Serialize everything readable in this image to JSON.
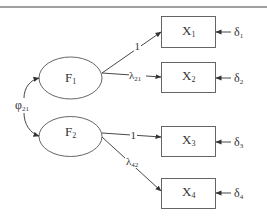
{
  "diagram": {
    "type": "confirmatory-factor-analysis-path-diagram",
    "factors": [
      {
        "id": "F1",
        "label": "F",
        "sub": "1"
      },
      {
        "id": "F2",
        "label": "F",
        "sub": "2"
      }
    ],
    "indicators": [
      {
        "id": "X1",
        "label": "X",
        "sub": "1"
      },
      {
        "id": "X2",
        "label": "X",
        "sub": "2"
      },
      {
        "id": "X3",
        "label": "X",
        "sub": "3"
      },
      {
        "id": "X4",
        "label": "X",
        "sub": "4"
      }
    ],
    "errors": [
      {
        "id": "d1",
        "label": "δ",
        "sub": "1"
      },
      {
        "id": "d2",
        "label": "δ",
        "sub": "2"
      },
      {
        "id": "d3",
        "label": "δ",
        "sub": "3"
      },
      {
        "id": "d4",
        "label": "δ",
        "sub": "4"
      }
    ],
    "loadings": [
      {
        "from": "F1",
        "to": "X1",
        "label": "1",
        "sub": ""
      },
      {
        "from": "F1",
        "to": "X2",
        "label": "λ",
        "sub": "21"
      },
      {
        "from": "F2",
        "to": "X3",
        "label": "1",
        "sub": ""
      },
      {
        "from": "F2",
        "to": "X4",
        "label": "λ",
        "sub": "42"
      }
    ],
    "covariance": {
      "between": [
        "F1",
        "F2"
      ],
      "label": "φ",
      "sub": "21"
    }
  }
}
